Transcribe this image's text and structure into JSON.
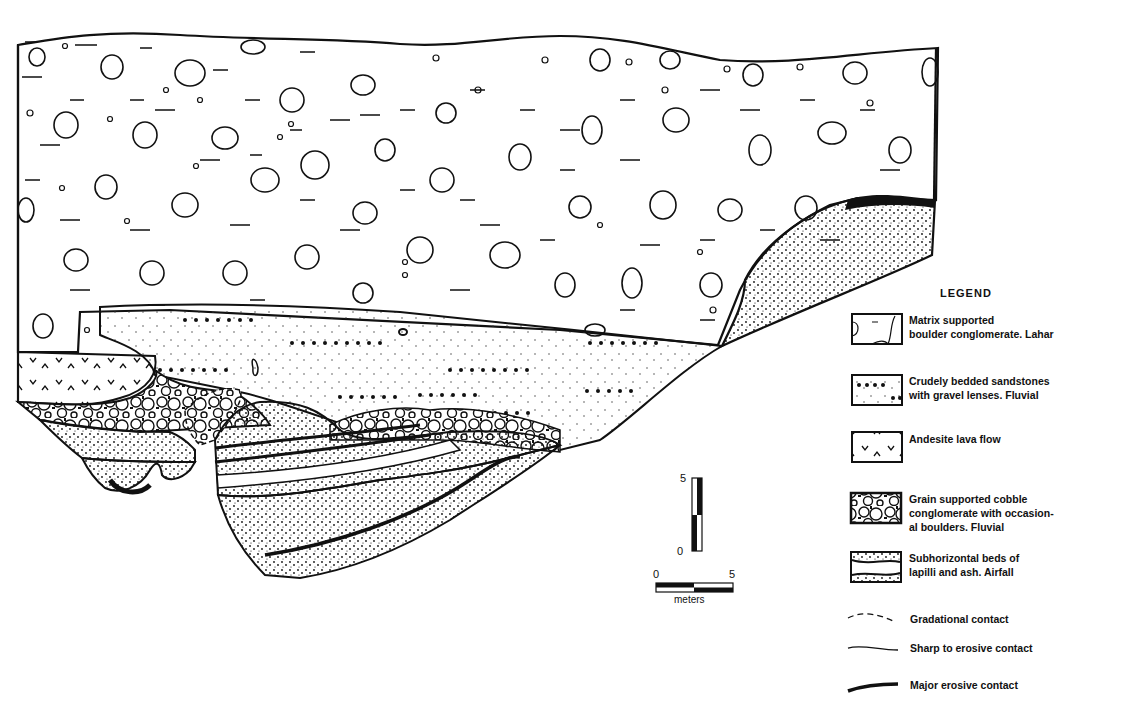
{
  "figure": {
    "type": "geological cross-section",
    "legend": {
      "title": "LEGEND",
      "units": [
        {
          "id": "lahar",
          "label": "Matrix supported\nboulder conglomerate. Lahar",
          "pattern": "boulders-in-matrix"
        },
        {
          "id": "fluvial-sandstone",
          "label": "Crudely bedded sandstones\nwith gravel lenses. Fluvial",
          "pattern": "stipple-with-dot-rows"
        },
        {
          "id": "andesite",
          "label": "Andesite lava flow",
          "pattern": "v-marks"
        },
        {
          "id": "cobble-conglomerate",
          "label": "Grain supported cobble\nconglomerate with occasion-\nal boulders. Fluvial",
          "pattern": "packed-cobbles"
        },
        {
          "id": "airfall",
          "label": "Subhorizontal beds of\nlapilli and ash. Airfall",
          "pattern": "dense-stipple-bands"
        }
      ],
      "contacts": [
        {
          "id": "gradational",
          "label": "Gradational contact",
          "line": "dashed"
        },
        {
          "id": "sharp",
          "label": "Sharp to erosive contact",
          "line": "thin"
        },
        {
          "id": "major",
          "label": "Major erosive contact",
          "line": "thick"
        }
      ]
    },
    "scale": {
      "vertical": {
        "top": "5",
        "bottom": "0"
      },
      "horizontal": {
        "left": "0",
        "right": "5",
        "unit": "meters"
      }
    }
  }
}
